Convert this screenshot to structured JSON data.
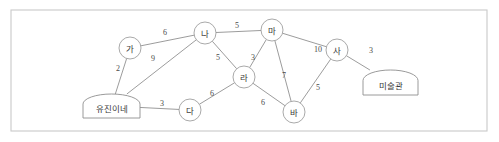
{
  "figure": {
    "kind": "weighted-undirected-graph",
    "frame": {
      "x": 11,
      "y": 10,
      "width": 476,
      "height": 121
    }
  },
  "chart_data": {
    "type": "diagram",
    "title": "",
    "nodes": [
      {
        "id": "ga",
        "label": "가",
        "shape": "circle",
        "x": 130,
        "y": 48,
        "r": 11
      },
      {
        "id": "na",
        "label": "나",
        "shape": "circle",
        "x": 205,
        "y": 33,
        "r": 11
      },
      {
        "id": "da",
        "label": "다",
        "shape": "circle",
        "x": 190,
        "y": 110,
        "r": 11
      },
      {
        "id": "ra",
        "label": "라",
        "shape": "circle",
        "x": 244,
        "y": 77,
        "r": 11
      },
      {
        "id": "ma",
        "label": "마",
        "shape": "circle",
        "x": 272,
        "y": 30,
        "r": 11
      },
      {
        "id": "ba",
        "label": "바",
        "shape": "circle",
        "x": 294,
        "y": 112,
        "r": 11
      },
      {
        "id": "sa",
        "label": "사",
        "shape": "circle",
        "x": 337,
        "y": 50,
        "r": 11
      },
      {
        "id": "home",
        "label": "유진이네",
        "shape": "terminal",
        "x": 83,
        "y": 94,
        "width": 57,
        "height": 24
      },
      {
        "id": "museum",
        "label": "미술관",
        "shape": "terminal",
        "x": 363,
        "y": 70,
        "width": 55,
        "height": 25
      }
    ],
    "edges": [
      {
        "from": "home",
        "to": "ga",
        "weight": "2",
        "label_x": 118,
        "label_y": 68
      },
      {
        "from": "ga",
        "to": "na",
        "weight": "6",
        "label_x": 165,
        "label_y": 32
      },
      {
        "from": "home",
        "to": "na",
        "weight": "9",
        "label_x": 153,
        "label_y": 58
      },
      {
        "from": "home",
        "to": "da",
        "weight": "3",
        "label_x": 162,
        "label_y": 103
      },
      {
        "from": "na",
        "to": "ma",
        "weight": "5",
        "label_x": 237,
        "label_y": 25
      },
      {
        "from": "na",
        "to": "ra",
        "weight": "5",
        "label_x": 218,
        "label_y": 57
      },
      {
        "from": "ra",
        "to": "ma",
        "weight": "3",
        "label_x": 253,
        "label_y": 57
      },
      {
        "from": "da",
        "to": "ra",
        "weight": "6",
        "label_x": 212,
        "label_y": 93
      },
      {
        "from": "ra",
        "to": "ba",
        "weight": "6",
        "label_x": 263,
        "label_y": 102
      },
      {
        "from": "ma",
        "to": "ba",
        "weight": "7",
        "label_x": 284,
        "label_y": 75
      },
      {
        "from": "ma",
        "to": "sa",
        "weight": "10",
        "label_x": 318,
        "label_y": 49
      },
      {
        "from": "ba",
        "to": "sa",
        "weight": "5",
        "label_x": 318,
        "label_y": 87
      },
      {
        "from": "sa",
        "to": "museum",
        "weight": "3",
        "label_x": 371,
        "label_y": 50
      }
    ],
    "colors": {
      "frame_stroke": "#c9c9c9",
      "edge_stroke": "#8a8a8a",
      "node_stroke": "#9a9a9a",
      "node_fill": "#ffffff",
      "text": "#3a3a3a",
      "background": "#ffffff"
    }
  }
}
